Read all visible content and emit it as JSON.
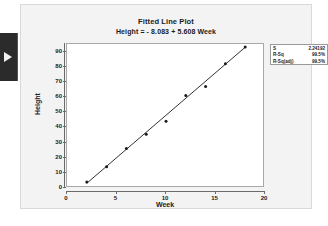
{
  "window": {
    "side_tab_icon": "play-arrow-icon"
  },
  "chart_data": {
    "type": "scatter",
    "title": "Fitted Line Plot",
    "subtitle": "Height = - 8.083 + 5.608 Week",
    "xlabel": "Week",
    "ylabel": "Height",
    "xlim": [
      0,
      20
    ],
    "ylim": [
      0,
      95
    ],
    "xticks": [
      0,
      5,
      10,
      15,
      20
    ],
    "yticks": [
      0,
      10,
      20,
      30,
      40,
      50,
      60,
      70,
      80,
      90
    ],
    "grid": false,
    "legend": "none",
    "series": [
      {
        "name": "Height",
        "x": [
          2,
          4,
          6,
          8,
          10,
          12,
          14,
          16,
          18
        ],
        "y": [
          4,
          14,
          26,
          35.5,
          44,
          61,
          67,
          82,
          93
        ]
      }
    ],
    "fit_line": {
      "name": "Fitted regression line",
      "intercept": -8.083,
      "slope": 5.608,
      "x_start": 2,
      "x_end": 18
    },
    "annotations": {
      "stats": [
        {
          "label": "S",
          "value": "2.24192"
        },
        {
          "label": "R-Sq",
          "value": "99.5%"
        },
        {
          "label": "R-Sq(adj)",
          "value": "99.5%"
        }
      ]
    },
    "colors": {
      "marker": "#1b1b1b",
      "line": "#1b1b1b",
      "plot_background": "#ffffff",
      "panel_background": "#f3f3f3",
      "axis": "#6a6a6a"
    }
  }
}
